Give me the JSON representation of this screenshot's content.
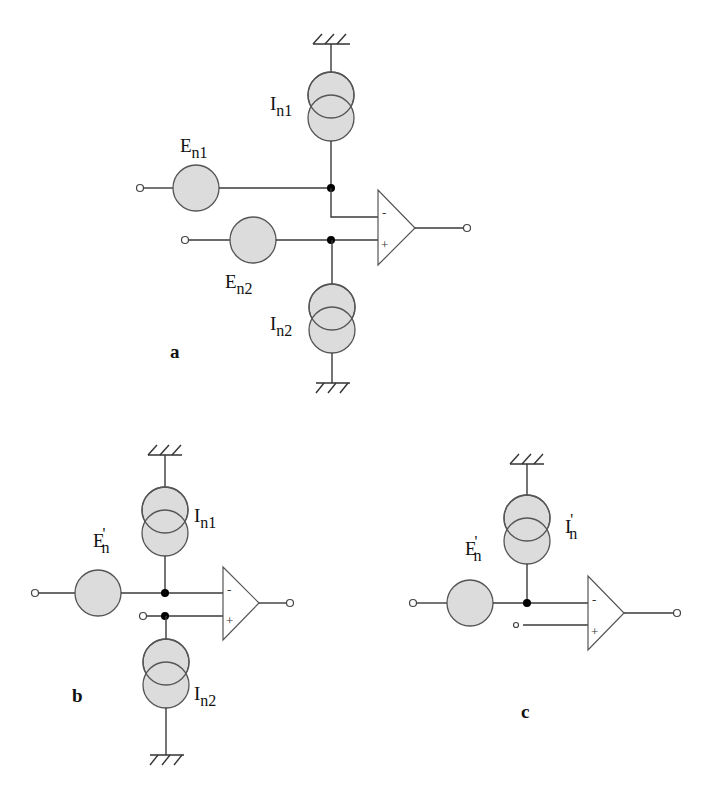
{
  "figure": {
    "colors": {
      "source_fill": "#dcdcdc",
      "stroke": "#555555",
      "node": "#000000",
      "background": "#ffffff"
    },
    "panels": [
      {
        "id": "a",
        "label": "a",
        "voltage_sources": [
          {
            "name": "E",
            "subscript": "n1"
          },
          {
            "name": "E",
            "subscript": "n2"
          }
        ],
        "current_sources": [
          {
            "name": "I",
            "subscript": "n1"
          },
          {
            "name": "I",
            "subscript": "n2"
          }
        ],
        "opamp": {
          "inverting": "-",
          "noninverting": "+"
        }
      },
      {
        "id": "b",
        "label": "b",
        "voltage_sources": [
          {
            "name": "E",
            "prime": "'",
            "subscript": "n"
          }
        ],
        "current_sources": [
          {
            "name": "I",
            "subscript": "n1"
          },
          {
            "name": "I",
            "subscript": "n2"
          }
        ],
        "opamp": {
          "inverting": "-",
          "noninverting": "+"
        }
      },
      {
        "id": "c",
        "label": "c",
        "voltage_sources": [
          {
            "name": "E",
            "prime": "'",
            "subscript": "n"
          }
        ],
        "current_sources": [
          {
            "name": "I",
            "prime": "'",
            "subscript": "n"
          }
        ],
        "opamp": {
          "inverting": "-",
          "noninverting": "+"
        }
      }
    ]
  }
}
